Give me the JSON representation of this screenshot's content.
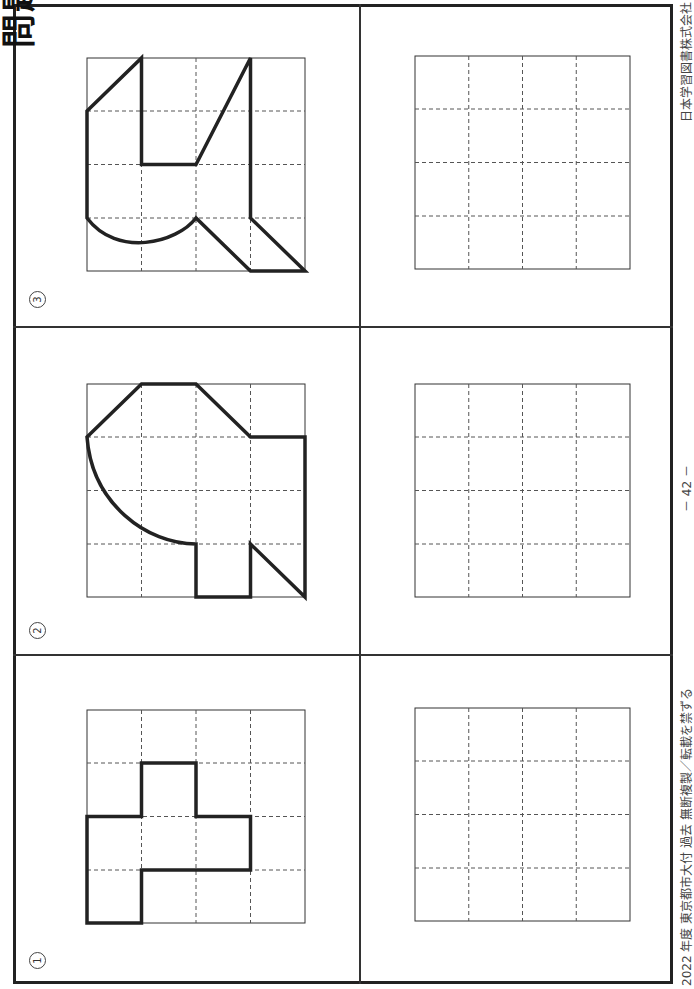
{
  "header": {
    "title_fragment": "問題26"
  },
  "problems": [
    {
      "label": "①",
      "number": 1
    },
    {
      "label": "②",
      "number": 2
    },
    {
      "label": "③",
      "number": 3
    }
  ],
  "grid": {
    "rows": 4,
    "cols": 4
  },
  "footer": {
    "left_text": "2022 年度  東京都市大付  過去  無断複製／転載を禁ずる",
    "page_number": "－ 42 －",
    "publisher": "日本学習図書株式会社"
  },
  "colors": {
    "ink": "#222222",
    "grid_line": "#555555"
  }
}
